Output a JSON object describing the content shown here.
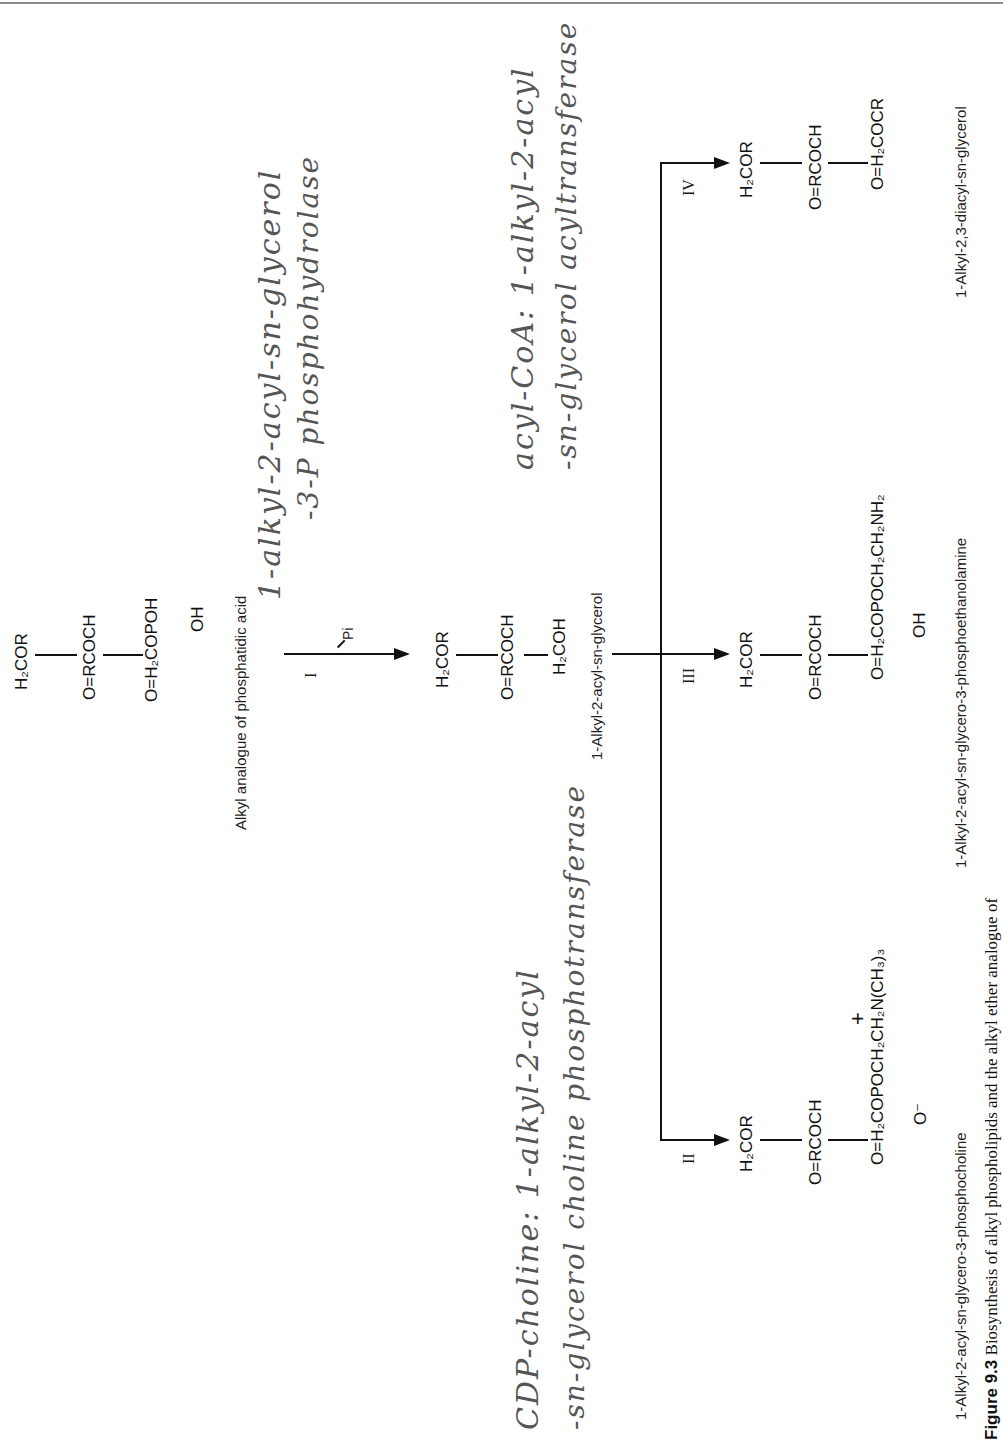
{
  "figure": {
    "caption_label": "Figure 9.3",
    "caption_text": "Biosynthesis of alkyl phospholipids and the alkyl ether analogue of"
  },
  "compounds": {
    "phosphatidic_analogue": {
      "name": "Alkyl analogue of phosphatidic acid",
      "rows": [
        "H₂COR",
        "O=RCOCH",
        "O=H₂COPOH",
        "OH"
      ]
    },
    "diacylglycerol_precursor": {
      "name": "1-Alkyl-2-acyl-sn-glycerol",
      "rows": [
        "H₂COR",
        "O=RCOCH",
        "H₂COH"
      ]
    },
    "phosphocholine": {
      "name": "1-Alkyl-2-acyl-sn-glycero-3-phosphocholine",
      "rows": [
        "H₂COR",
        "O=RCOCH",
        "O=H₂COPOCH₂CH₂N(CH₃)₃",
        "O⁻",
        "+"
      ]
    },
    "phosphoethanolamine": {
      "name": "1-Alkyl-2-acyl-sn-glycero-3-phosphoethanolamine",
      "rows": [
        "H₂COR",
        "O=RCOCH",
        "O=H₂COPOCH₂CH₂NH₂",
        "OH"
      ]
    },
    "triacylglycerol": {
      "name": "1-Alkyl-2,3-diacyl-sn-glycerol",
      "rows": [
        "H₂COR",
        "O=RCOCH",
        "O=H₂COCR"
      ]
    }
  },
  "reactions": {
    "I": {
      "label": "I",
      "byproduct": "Pi"
    },
    "II": {
      "label": "II"
    },
    "III": {
      "label": "III"
    },
    "IV": {
      "label": "IV"
    }
  },
  "handwritten_notes": {
    "enzyme_I_line1": "1-alkyl-2-acyl-sn-glycerol",
    "enzyme_I_line2": "-3-P phosphohydrolase",
    "enzyme_IV_line1": "acyl-CoA: 1-alkyl-2-acyl",
    "enzyme_IV_line2": "-sn-glycerol acyltransferase",
    "enzyme_II_line1": "CDP-choline: 1-alkyl-2-acyl",
    "enzyme_II_line2": "-sn-glycerol choline phosphotransferase"
  }
}
